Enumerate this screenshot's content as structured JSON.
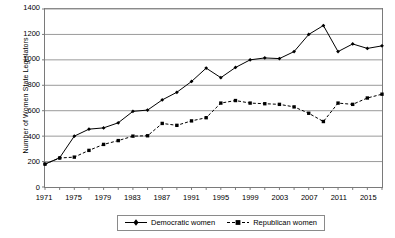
{
  "chart_data": {
    "type": "line",
    "title": "",
    "xlabel": "",
    "ylabel": "Number of Women State Legislators",
    "ylim": [
      0,
      1400
    ],
    "ytick_step": 200,
    "yticks": [
      0,
      200,
      400,
      600,
      800,
      1000,
      1200,
      1400
    ],
    "grid": "horizontal",
    "legend_position": "bottom-center",
    "x": [
      1971,
      1973,
      1975,
      1977,
      1979,
      1981,
      1983,
      1985,
      1987,
      1989,
      1991,
      1993,
      1995,
      1997,
      1999,
      2001,
      2003,
      2005,
      2007,
      2009,
      2011,
      2013,
      2015,
      2017
    ],
    "xtick_labels": [
      "1971",
      "1975",
      "1979",
      "1983",
      "1987",
      "1991",
      "1995",
      "1999",
      "2003",
      "2007",
      "2011",
      "2015"
    ],
    "xtick_label_years": [
      1971,
      1975,
      1979,
      1983,
      1987,
      1991,
      1995,
      1999,
      2003,
      2007,
      2011,
      2015
    ],
    "series": [
      {
        "name": "Democratic women",
        "marker": "diamond",
        "line_style": "solid",
        "color": "#000000",
        "values": [
          180,
          230,
          400,
          455,
          465,
          505,
          595,
          605,
          685,
          745,
          830,
          935,
          860,
          940,
          1000,
          1015,
          1010,
          1065,
          1200,
          1270,
          1065,
          1125,
          1090,
          1110
        ]
      },
      {
        "name": "Republican women",
        "marker": "square",
        "line_style": "dashed",
        "color": "#000000",
        "values": [
          180,
          228,
          235,
          288,
          335,
          365,
          400,
          403,
          500,
          485,
          520,
          545,
          660,
          680,
          660,
          655,
          650,
          630,
          580,
          515,
          660,
          650,
          700,
          730
        ]
      }
    ]
  },
  "legend": {
    "entries": [
      {
        "label": "Democratic women",
        "icon": "solid-line-diamond-marker"
      },
      {
        "label": "Republican women",
        "icon": "dashed-line-square-marker"
      }
    ]
  },
  "axes": {
    "y_title": "Number of Women State Legislators"
  },
  "colors": {
    "grid": "#9a9a9a",
    "frame": "#7a7a7a",
    "series": "#000000",
    "background": "#ffffff"
  }
}
